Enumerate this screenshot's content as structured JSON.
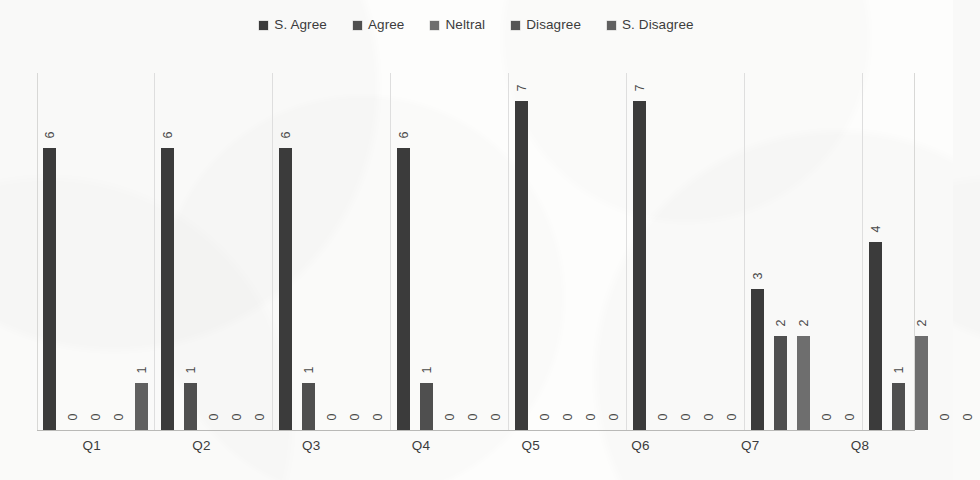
{
  "chart_data": {
    "type": "bar",
    "title": "",
    "subtitle": "",
    "xlabel": "",
    "ylabel": "",
    "ylim": [
      0,
      7.6
    ],
    "grid": false,
    "legend_position": "top",
    "orientation": "vertical",
    "data_labels": true,
    "data_label_rotation": -90,
    "categories": [
      "Q1",
      "Q2",
      "Q3",
      "Q4",
      "Q5",
      "Q6",
      "Q7",
      "Q8"
    ],
    "series": [
      {
        "name": "S. Agree",
        "color": "#3b3b3b",
        "values": [
          6,
          6,
          6,
          6,
          7,
          7,
          3,
          4
        ]
      },
      {
        "name": "Agree",
        "color": "#4f4f4f",
        "values": [
          0,
          1,
          1,
          1,
          0,
          0,
          2,
          1
        ]
      },
      {
        "name": "Neltral",
        "color": "#6e6e6e",
        "values": [
          0,
          0,
          0,
          0,
          0,
          0,
          2,
          2
        ]
      },
      {
        "name": "Disagree",
        "color": "#555555",
        "values": [
          0,
          0,
          0,
          0,
          0,
          0,
          0,
          0
        ]
      },
      {
        "name": "S. Disagree",
        "color": "#606060",
        "values": [
          1,
          0,
          0,
          0,
          0,
          0,
          0,
          0
        ]
      }
    ]
  },
  "legend": {
    "items": [
      {
        "label": "S. Agree",
        "color": "#3b3b3b"
      },
      {
        "label": "Agree",
        "color": "#4f4f4f"
      },
      {
        "label": "Neltral",
        "color": "#6e6e6e"
      },
      {
        "label": "Disagree",
        "color": "#555555"
      },
      {
        "label": "S. Disagree",
        "color": "#606060"
      }
    ]
  },
  "axis": {
    "tick_labels": [
      "Q1",
      "Q2",
      "Q3",
      "Q4",
      "Q5",
      "Q6",
      "Q7",
      "Q8"
    ]
  }
}
